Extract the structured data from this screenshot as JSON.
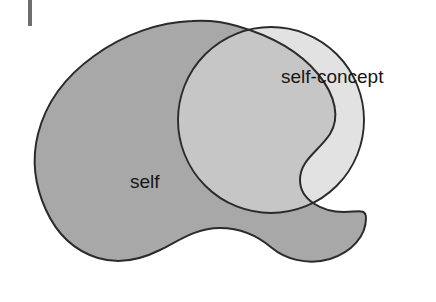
{
  "figure": {
    "type": "venn-diagram",
    "background_color": "#ffffff",
    "outline_color": "#2b2b2b",
    "margin_mark": {
      "name": "margin-tick-mark",
      "color": "#6e6e6e",
      "x": 28,
      "y": 0,
      "width": 4,
      "height": 26
    },
    "regions": [
      {
        "id": "self",
        "label": "self",
        "fill_color": "#a8a8a8",
        "label_x": 130,
        "label_y": 183
      },
      {
        "id": "self-concept",
        "label": "self-concept",
        "fill_color": "#e2e2e2",
        "label_x": 281,
        "label_y": 78
      },
      {
        "id": "overlap",
        "label": "",
        "fill_color": "#c6c6c6"
      }
    ]
  }
}
